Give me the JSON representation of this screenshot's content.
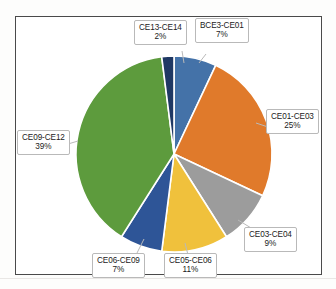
{
  "chart_data": {
    "type": "pie",
    "title": "",
    "legend": "none",
    "labels_show_category": true,
    "labels_show_percent": true,
    "categories": [
      "BCE3-CE01",
      "CE01-CE03",
      "CE03-CE04",
      "CE05-CE06",
      "CE06-CE09",
      "CE09-CE12",
      "CE13-CE14"
    ],
    "values": [
      7,
      25,
      9,
      11,
      7,
      39,
      2
    ],
    "unit": "%",
    "slices": [
      {
        "label": "BCE3-CE01",
        "percent_text": "7%",
        "value": 7,
        "color": "#4472A8"
      },
      {
        "label": "CE01-CE03",
        "percent_text": "25%",
        "value": 25,
        "color": "#E07A2B"
      },
      {
        "label": "CE03-CE04",
        "percent_text": "9%",
        "value": 9,
        "color": "#9C9C9C"
      },
      {
        "label": "CE05-CE06",
        "percent_text": "11%",
        "value": 11,
        "color": "#F0C13C"
      },
      {
        "label": "CE06-CE09",
        "percent_text": "7%",
        "value": 7,
        "color": "#2E5597"
      },
      {
        "label": "CE09-CE12",
        "percent_text": "39%",
        "value": 39,
        "color": "#5D9B3D"
      },
      {
        "label": "CE13-CE14",
        "percent_text": "2%",
        "value": 2,
        "color": "#1F3864"
      }
    ]
  }
}
